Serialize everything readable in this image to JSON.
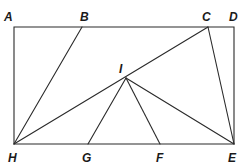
{
  "diagram": {
    "type": "geometry-figure",
    "stroke_color": "#2a2a2a",
    "points": {
      "A": {
        "label": "A",
        "x": 14,
        "y": 27,
        "lx": 4,
        "ly": 21
      },
      "B": {
        "label": "B",
        "x": 82,
        "y": 27,
        "lx": 80,
        "ly": 21
      },
      "C": {
        "label": "C",
        "x": 208,
        "y": 27,
        "lx": 202,
        "ly": 21
      },
      "D": {
        "label": "D",
        "x": 234,
        "y": 27,
        "lx": 229,
        "ly": 21
      },
      "E": {
        "label": "E",
        "x": 234,
        "y": 144,
        "lx": 228,
        "ly": 162
      },
      "F": {
        "label": "F",
        "x": 160,
        "y": 144,
        "lx": 156,
        "ly": 162
      },
      "G": {
        "label": "G",
        "x": 88,
        "y": 144,
        "lx": 82,
        "ly": 162
      },
      "H": {
        "label": "H",
        "x": 14,
        "y": 144,
        "lx": 8,
        "ly": 162
      },
      "I": {
        "label": "I",
        "x": 126,
        "y": 78,
        "lx": 119,
        "ly": 73
      }
    },
    "rectangle": [
      "A",
      "D",
      "E",
      "H"
    ],
    "segments": [
      [
        "H",
        "B"
      ],
      [
        "H",
        "C"
      ],
      [
        "C",
        "E"
      ],
      [
        "I",
        "G"
      ],
      [
        "I",
        "F"
      ],
      [
        "I",
        "E"
      ]
    ]
  }
}
